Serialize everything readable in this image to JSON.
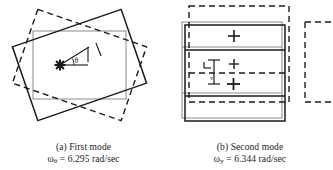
{
  "figure": {
    "type": "engineering-mode-shape-diagram",
    "panels": [
      {
        "id": "a",
        "caption_label": "(a) First mode",
        "caption_symbol": "ω",
        "caption_subscript": "θ",
        "caption_equals": " = 6.295 rad/sec",
        "caption_value": "6.295",
        "caption_units": "rad/sec",
        "angle_label": "θ",
        "shapes": {
          "reference_rectangle": "gray axis-aligned rectangle",
          "solid_rotated_rectangle": "black solid rectangle rotated counter-clockwise",
          "dashed_rotated_rectangle": "black dashed rectangle rotated clockwise",
          "center_marker": "star-marker",
          "direction_arrow": "arrow-up-right"
        }
      },
      {
        "id": "b",
        "caption_label": "(b) Second mode",
        "caption_symbol": "ω",
        "caption_subscript": "y",
        "caption_equals": " = 6.344 rad/sec",
        "caption_value": "6.344",
        "caption_units": "rad/sec",
        "shapes": {
          "reference_rectangle": "gray axis-aligned stacked rectangle",
          "solid_rectangle": "black solid rectangle",
          "dashed_rectangle": "black dashed rectangle offset up and right",
          "cross_markers": "plus-markers",
          "dimension_arrow": "vertical-double-arrow",
          "partial_rectangle": "clipped dashed rectangle at right edge"
        }
      }
    ]
  },
  "colors": {
    "solid_line": "#1a1a1a",
    "gray_line": "#8a8a8a",
    "dashed_line": "#1a1a1a",
    "background": "#ffffff"
  }
}
